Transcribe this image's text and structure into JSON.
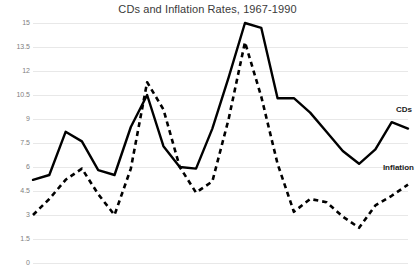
{
  "chart_data": {
    "type": "line",
    "title": "CDs and Inflation Rates, 1967-1990",
    "xlabel": "",
    "ylabel": "",
    "ylim": [
      0,
      15
    ],
    "yticks": [
      15,
      13.5,
      12,
      10.5,
      9,
      7.5,
      6,
      4.5,
      3,
      1.5,
      0
    ],
    "ytick_labels": [
      "15",
      "13.5",
      "12",
      "10.5",
      "9",
      "7.5",
      "6",
      "4.5",
      "3",
      "1.5",
      "0"
    ],
    "grid": true,
    "legend_position": "inline-right",
    "x": [
      1967,
      1968,
      1969,
      1970,
      1971,
      1972,
      1973,
      1974,
      1975,
      1976,
      1977,
      1978,
      1979,
      1980,
      1981,
      1982,
      1983,
      1984,
      1985,
      1986,
      1987,
      1988,
      1989,
      1990
    ],
    "series": [
      {
        "name": "CDs",
        "style": "solid",
        "color": "#000000",
        "values": [
          5.2,
          5.5,
          8.2,
          7.6,
          5.8,
          5.5,
          8.5,
          10.5,
          7.3,
          6.0,
          5.9,
          8.4,
          11.6,
          15.0,
          14.7,
          10.3,
          10.3,
          9.4,
          8.2,
          7.0,
          6.2,
          7.1,
          8.8,
          8.4
        ]
      },
      {
        "name": "Inflation",
        "style": "dashed",
        "color": "#000000",
        "values": [
          3.0,
          4.0,
          5.2,
          5.9,
          4.3,
          3.0,
          5.9,
          11.3,
          9.6,
          6.0,
          4.4,
          5.1,
          9.0,
          13.8,
          10.4,
          6.2,
          3.2,
          4.0,
          3.8,
          2.9,
          2.2,
          3.6,
          4.2,
          4.9
        ]
      }
    ]
  }
}
